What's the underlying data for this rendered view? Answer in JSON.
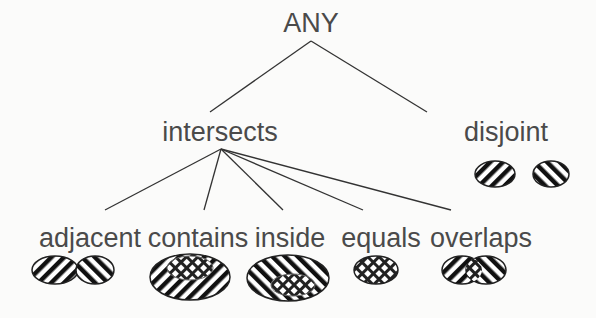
{
  "diagram": {
    "root": {
      "label": "ANY"
    },
    "level1": [
      {
        "label": "intersects"
      },
      {
        "label": "disjoint"
      }
    ],
    "level2": [
      {
        "label": "adjacent"
      },
      {
        "label": "contains"
      },
      {
        "label": "inside"
      },
      {
        "label": "equals"
      },
      {
        "label": "overlaps"
      }
    ],
    "edges": [
      [
        "ANY",
        "intersects"
      ],
      [
        "ANY",
        "disjoint"
      ],
      [
        "intersects",
        "adjacent"
      ],
      [
        "intersects",
        "contains"
      ],
      [
        "intersects",
        "inside"
      ],
      [
        "intersects",
        "equals"
      ],
      [
        "intersects",
        "overlaps"
      ]
    ],
    "colors": {
      "text": "#4a4a4a",
      "line": "#333333",
      "hatch": "#111111"
    }
  }
}
